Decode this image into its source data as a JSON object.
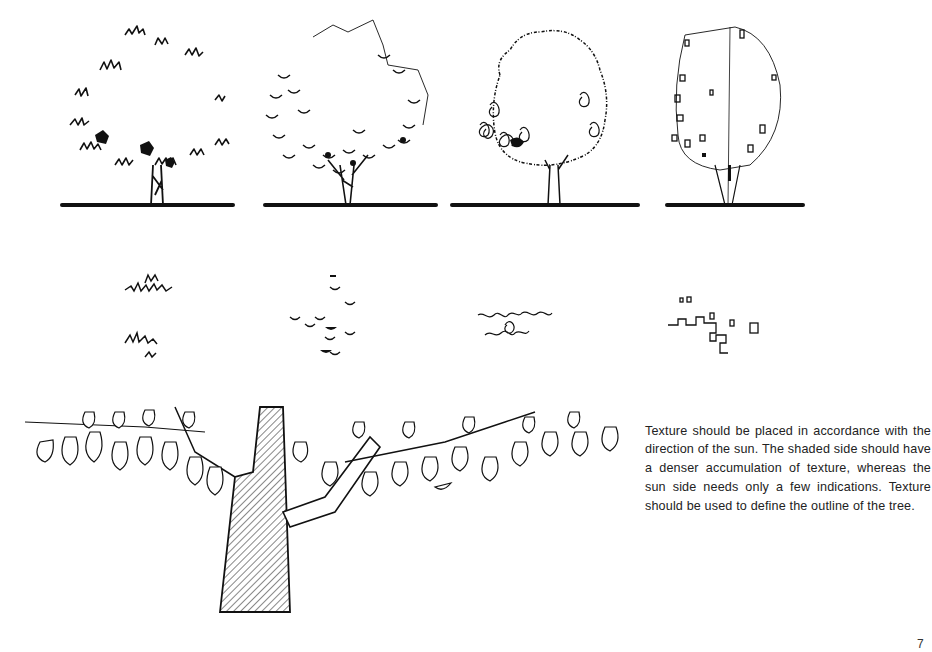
{
  "page": {
    "number": "7",
    "background": "#ffffff",
    "ink_color": "#111111"
  },
  "figures": {
    "tree_elevations": [
      {
        "texture": "spiky-leaf",
        "description": "tree with spiky leaf-cluster texture concentrated on shaded lower-left"
      },
      {
        "texture": "half-moon-leaf",
        "description": "tree with scalloped half-moon leaf texture and light outline on sun side"
      },
      {
        "texture": "squiggle-loop",
        "description": "tree with dense looping squiggle texture"
      },
      {
        "texture": "rectangular-block",
        "description": "tree with small rectangular block texture and thin outline"
      }
    ],
    "texture_swatches": [
      {
        "texture": "spiky-leaf"
      },
      {
        "texture": "half-moon-leaf"
      },
      {
        "texture": "squiggle-loop"
      },
      {
        "texture": "rectangular-block"
      }
    ],
    "detail": {
      "description": "close-up of tree trunk with hatched shading and branches bearing large leaves"
    }
  },
  "caption": {
    "text": "Texture should be placed in accordance with the direction of the sun. The shaded side should have a denser accumulation of texture, whereas the sun side needs only a few indications. Texture should be used to define the outline of the tree."
  }
}
